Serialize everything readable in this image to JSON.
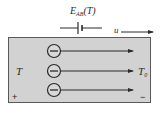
{
  "diagram": {
    "emf_label": {
      "main": "E",
      "sub": "AB",
      "arg": "(T)"
    },
    "velocity_label": "u",
    "hot_side_label": "T",
    "cold_side_label": {
      "main": "T",
      "sub": "0"
    },
    "plus_sign": "+",
    "minus_sign": "−",
    "charges": [
      {
        "symbol": "electron",
        "y": 51
      },
      {
        "symbol": "electron",
        "y": 71
      },
      {
        "symbol": "electron",
        "y": 90
      }
    ],
    "colors": {
      "conductor_fill": "#d2d2d2",
      "conductor_border": "#5a5a5a",
      "line": "#2a2a2a"
    }
  }
}
